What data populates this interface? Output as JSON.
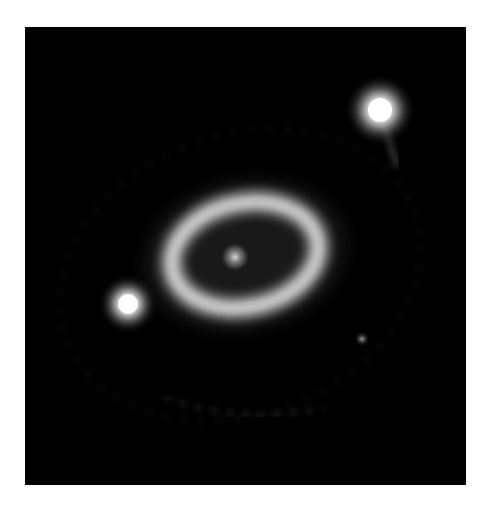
{
  "image": {
    "subject": "ring nebula with central source and bright stars",
    "background_color": "#000000",
    "page_color": "#ffffff"
  },
  "objects": [
    {
      "name": "central-source",
      "cx": 210,
      "cy": 230
    },
    {
      "name": "inner-ring",
      "cx": 220,
      "cy": 228,
      "rx": 75,
      "ry": 52,
      "rotate": -12
    },
    {
      "name": "star-upper-right",
      "cx": 355,
      "cy": 83
    },
    {
      "name": "star-left",
      "cx": 103,
      "cy": 277
    },
    {
      "name": "faint-star",
      "cx": 337,
      "cy": 312
    }
  ]
}
